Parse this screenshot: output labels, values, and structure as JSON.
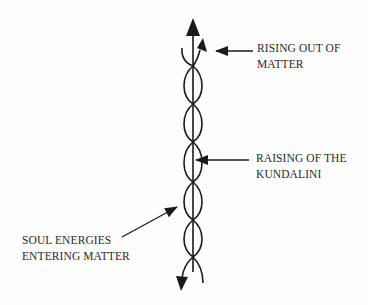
{
  "diagram": {
    "type": "helix-with-axis",
    "colors": {
      "stroke": "#1a1a1a",
      "text": "#2a2a2a",
      "background": "#fefefe"
    },
    "labels": [
      {
        "id": "rising",
        "lines": [
          "RISING OUT OF",
          "MATTER"
        ]
      },
      {
        "id": "kundalini",
        "lines": [
          "RAISING OF THE",
          "KUNDALINI"
        ]
      },
      {
        "id": "soul",
        "lines": [
          "SOUL ENERGIES",
          "ENTERING MATTER"
        ]
      }
    ]
  }
}
